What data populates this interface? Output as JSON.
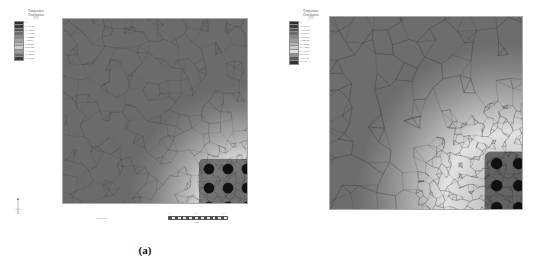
{
  "figure": {
    "background_color": "#ffffff",
    "panels": [
      {
        "id": "a",
        "caption": "(a)",
        "legend": {
          "title": "Temperature\nDistribution",
          "units": "[°C]",
          "entries": [
            {
              "value": "0",
              "color": "#2b2b2b"
            },
            {
              "value": "0.17716",
              "color": "#3d3d3d"
            },
            {
              "value": "0.71862",
              "color": "#555555"
            },
            {
              "value": "1.17186",
              "color": "#6e6e6e"
            },
            {
              "value": "1.54846",
              "color": "#878787"
            },
            {
              "value": "1.8869",
              "color": "#a0a0a0"
            },
            {
              "value": "2.22286",
              "color": "#b8b8b8"
            },
            {
              "value": "2.60722",
              "color": "#cfcfcf"
            },
            {
              "value": "1.90166",
              "color": "#9a9a9a"
            },
            {
              "value": "2.34441",
              "color": "#6a6a6a"
            },
            {
              "value": "2.71884",
              "color": "#3a3a3a"
            }
          ]
        },
        "axis_triad": {
          "x_label": "X",
          "y_label": "Y"
        },
        "scale_bar": {
          "ticks": [
            "0",
            "15",
            "30"
          ],
          "unit": "mm"
        },
        "model_id": "07408.08",
        "mesh": {
          "density": "fine",
          "element_type": "triangular",
          "hole_array_rows": 5,
          "hole_array_cols": 5
        }
      },
      {
        "id": "b",
        "caption": "(b)",
        "legend": {
          "title": "Temperature\nDistribution",
          "units": "[°C]",
          "entries": [
            {
              "value": "0",
              "color": "#2b2b2b"
            },
            {
              "value": "0.19672",
              "color": "#3d3d3d"
            },
            {
              "value": "1.27984",
              "color": "#525252"
            },
            {
              "value": "1.98816",
              "color": "#6b6b6b"
            },
            {
              "value": "2.71688",
              "color": "#848484"
            },
            {
              "value": "3.44326",
              "color": "#9d9d9d"
            },
            {
              "value": "4.16286",
              "color": "#b5b5b5"
            },
            {
              "value": "4.13821",
              "color": "#cccccc"
            },
            {
              "value": "3.11583",
              "color": "#e0e0e0"
            },
            {
              "value": "2.61770",
              "color": "#8e8e8e"
            },
            {
              "value": "7.07147",
              "color": "#5a5a5a"
            },
            {
              "value": "5.999.13",
              "color": "#333333"
            }
          ]
        },
        "axis_triad": {
          "x_label": "X",
          "y_label": "Y"
        },
        "scale_bar": {
          "ticks": [
            "0",
            "15",
            "30"
          ],
          "unit": "mm"
        },
        "model_id": "2024.04.03",
        "mesh": {
          "density": "coarse",
          "element_type": "triangular",
          "hole_array_rows": 5,
          "hole_array_cols": 5
        }
      }
    ]
  }
}
